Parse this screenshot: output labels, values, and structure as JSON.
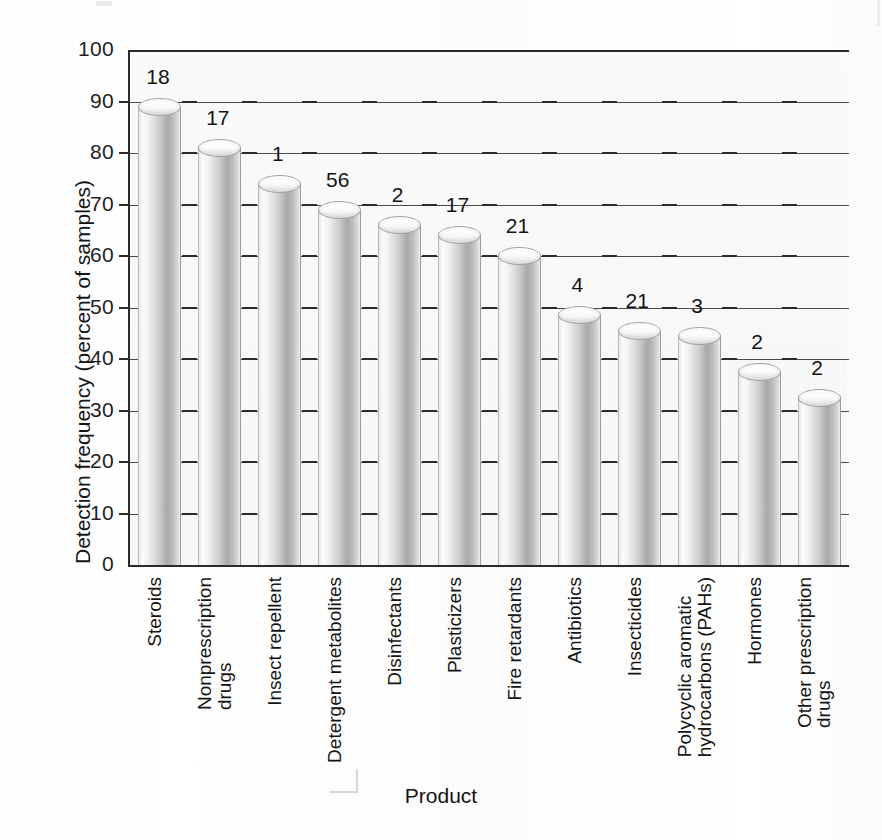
{
  "chart_data": {
    "type": "bar",
    "title": "",
    "subtitle": "",
    "xlabel": "Product",
    "ylabel": "Detection frequency (percent of samples)",
    "ylim": [
      0,
      100
    ],
    "ytick_values": [
      0,
      10,
      20,
      30,
      40,
      50,
      60,
      70,
      80,
      90,
      100
    ],
    "ytick_labels": [
      "0",
      "10",
      "20",
      "30",
      "40",
      "50",
      "60",
      "70",
      "80",
      "90",
      "100"
    ],
    "grid": "horizontal",
    "legend": "none",
    "orientation": "vertical",
    "bar_style": "3d-cylinder-grayscale",
    "categories": [
      "Steroids",
      "Nonprescription drugs",
      "Insect repellent",
      "Detergent metabolites",
      "Disinfectants",
      "Plasticizers",
      "Fire retardants",
      "Antibiotics",
      "Insecticides",
      "Polycyclic aromatic hydrocarbons (PAHs)",
      "Hormones",
      "Other prescription drugs"
    ],
    "category_label_lines": [
      [
        "Steroids"
      ],
      [
        "Nonprescription",
        "drugs"
      ],
      [
        "Insect repellent"
      ],
      [
        "Detergent metabolites"
      ],
      [
        "Disinfectants"
      ],
      [
        "Plasticizers"
      ],
      [
        "Fire retardants"
      ],
      [
        "Antibiotics"
      ],
      [
        "Insecticides"
      ],
      [
        "Polycyclic aromatic",
        "hydrocarbons (PAHs)"
      ],
      [
        "Hormones"
      ],
      [
        "Other prescription",
        "drugs"
      ]
    ],
    "values": [
      89,
      81,
      74,
      69,
      66,
      64,
      60,
      48.5,
      45.5,
      44.5,
      37.5,
      32.5
    ],
    "point_labels": [
      "18",
      "17",
      "1",
      "56",
      "2",
      "17",
      "21",
      "4",
      "21",
      "3",
      "2",
      "2"
    ],
    "point_label_meaning": "number of samples analyzed, printed above each bar",
    "series": [
      {
        "name": "Detection frequency",
        "values": [
          89,
          81,
          74,
          69,
          66,
          64,
          60,
          48.5,
          45.5,
          44.5,
          37.5,
          32.5
        ]
      }
    ],
    "colors": {
      "bar_light": "#fbfbfb",
      "bar_mid": "#c9c9ca",
      "bar_dark": "#a9a9ab",
      "axis": "#2b2b2b",
      "gridline": "#4a4a4a",
      "plot_background": "#f8f8f9",
      "text": "#141414"
    }
  }
}
